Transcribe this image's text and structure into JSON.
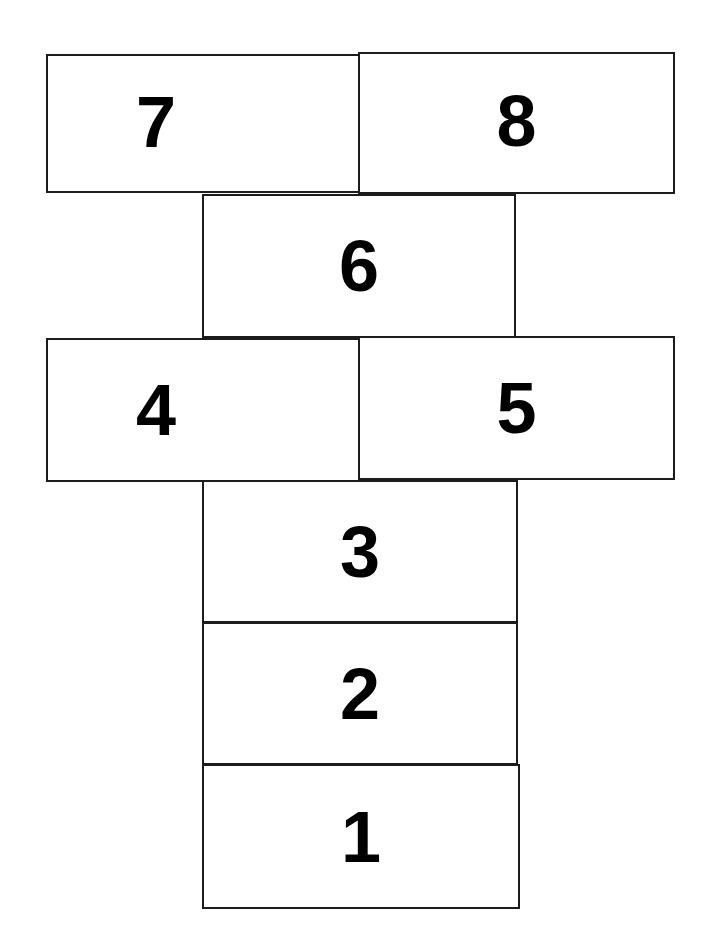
{
  "diagram": {
    "background_color": "#ffffff",
    "line_color": "#1c1c1c",
    "label_color": "#000000",
    "cells": [
      {
        "label": "7",
        "name": "hopscotch-cell-7"
      },
      {
        "label": "8",
        "name": "hopscotch-cell-8"
      },
      {
        "label": "6",
        "name": "hopscotch-cell-6"
      },
      {
        "label": "4",
        "name": "hopscotch-cell-4"
      },
      {
        "label": "5",
        "name": "hopscotch-cell-5"
      },
      {
        "label": "3",
        "name": "hopscotch-cell-3"
      },
      {
        "label": "2",
        "name": "hopscotch-cell-2"
      },
      {
        "label": "1",
        "name": "hopscotch-cell-1"
      }
    ]
  }
}
